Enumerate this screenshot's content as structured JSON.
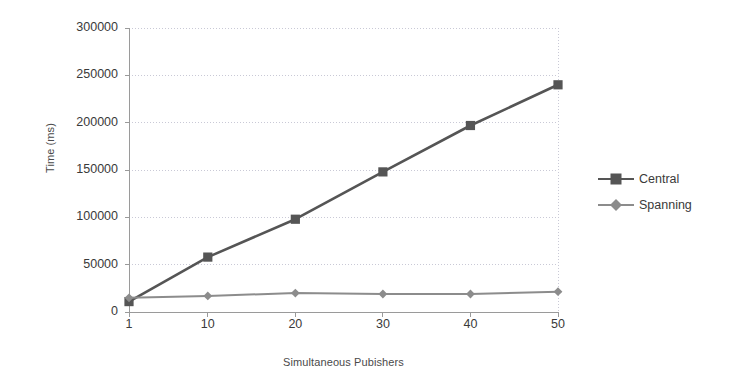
{
  "chart_data": {
    "type": "line",
    "title": "",
    "xlabel": "Simultaneous Pubishers",
    "ylabel": "Time (ms)",
    "x": [
      1,
      10,
      20,
      30,
      40,
      50
    ],
    "xtick_labels": [
      "1",
      "10",
      "20",
      "30",
      "40",
      "50"
    ],
    "ytick_labels": [
      "0",
      "50000",
      "100000",
      "150000",
      "200000",
      "250000",
      "300000"
    ],
    "ytick_values": [
      0,
      50000,
      100000,
      150000,
      200000,
      250000,
      300000
    ],
    "ylim": [
      0,
      300000
    ],
    "xlim": [
      1,
      50
    ],
    "grid": "horizontal-dotted",
    "legend_position": "right",
    "series": [
      {
        "name": "Central",
        "marker": "square",
        "color": "#555555",
        "values": [
          11000,
          58000,
          98000,
          148000,
          197000,
          240000
        ]
      },
      {
        "name": "Spanning",
        "marker": "diamond",
        "color": "#8c8c8c",
        "values": [
          15000,
          17000,
          20000,
          19000,
          19000,
          21500
        ]
      }
    ]
  },
  "colors": {
    "central": "#555555",
    "spanning": "#8c8c8c",
    "axis": "#9a9a9a",
    "grid": "#c9c9d6",
    "text": "#3a3a3a"
  }
}
